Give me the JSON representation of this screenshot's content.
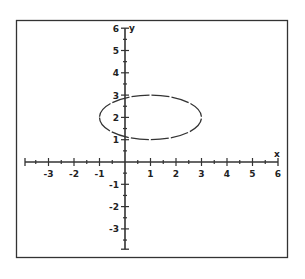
{
  "chart_data": {
    "type": "line",
    "title": "",
    "xlabel": "x",
    "ylabel": "y",
    "xlim": [
      -4,
      6
    ],
    "ylim": [
      -4,
      6
    ],
    "grid": false,
    "x_ticks": [
      -3,
      -2,
      -1,
      1,
      2,
      3,
      4,
      5,
      6
    ],
    "x_tick_labels": [
      "-3",
      "-2",
      "-1",
      "1",
      "2",
      "3",
      "4",
      "5",
      "6"
    ],
    "y_ticks": [
      -3,
      -2,
      -1,
      1,
      2,
      3,
      4,
      5,
      6
    ],
    "y_tick_labels": [
      "-3",
      "-2",
      "-1",
      "1",
      "2",
      "3",
      "4",
      "5",
      "6"
    ],
    "minor_tick_step": 0.5,
    "series": [
      {
        "name": "ellipse",
        "shape": "ellipse",
        "center": [
          1,
          2
        ],
        "semi_axis_x": 2,
        "semi_axis_y": 1,
        "equation": "(x-1)^2/4 + (y-2)^2 = 1",
        "style": "dashed"
      }
    ]
  }
}
